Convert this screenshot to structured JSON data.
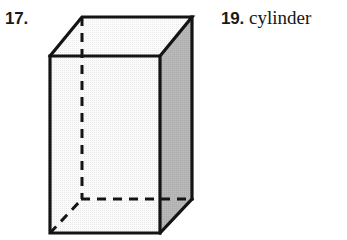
{
  "page": {
    "background_color": "#ffffff",
    "width": 347,
    "height": 240
  },
  "exercises": [
    {
      "number": "17.",
      "kind": "figure",
      "figure": {
        "name": "rectangular-prism",
        "description": "rectangular prism drawn in oblique projection with hidden edges dashed",
        "faces": {
          "front_fill": "#f0f0f0",
          "top_fill": "#f5f5f5",
          "right_fill": "#b3b3b3"
        },
        "outline_color": "#141414",
        "hidden_edge_style": "dashed",
        "vertices": {
          "front_top_left": [
            50,
            56
          ],
          "front_top_right": [
            160,
            56
          ],
          "front_bottom_right": [
            160,
            233
          ],
          "front_bottom_left": [
            50,
            233
          ],
          "back_top_left": [
            82,
            17
          ],
          "back_top_right": [
            192,
            17
          ],
          "back_bottom_right": [
            192,
            199
          ],
          "back_bottom_left": [
            82,
            199
          ]
        }
      }
    },
    {
      "number": "19.",
      "kind": "text",
      "answer": "cylinder"
    }
  ],
  "colors": {
    "ink": "#1a1a1a",
    "outline": "#141414",
    "front_face": "#f0f0f0",
    "top_face": "#f5f5f5",
    "right_face": "#b3b3b3",
    "paper": "#ffffff"
  }
}
